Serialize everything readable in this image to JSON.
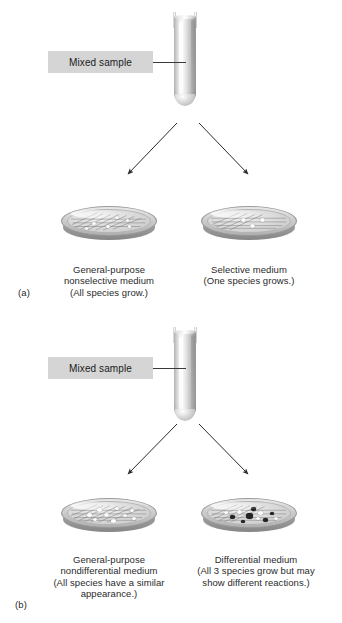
{
  "figure": {
    "background_color": "#ffffff",
    "label_box_color": "#d5d5d5"
  },
  "panels": [
    {
      "letter": "(a)",
      "tube_label": "Mixed sample",
      "dishes": [
        {
          "side": "left",
          "caption_lines": [
            "General-purpose",
            "nonselective medium",
            "(All species grow.)"
          ],
          "colonies": {
            "white_count": 6,
            "dark_count": 0
          },
          "streaked": true
        },
        {
          "side": "right",
          "caption_lines": [
            "Selective medium",
            "(One species grows.)"
          ],
          "colonies": {
            "white_count": 3,
            "dark_count": 0
          },
          "streaked": true
        }
      ]
    },
    {
      "letter": "(b)",
      "tube_label": "Mixed sample",
      "dishes": [
        {
          "side": "left",
          "caption_lines": [
            "General-purpose",
            "nondifferential medium",
            "(All species have a similar",
            "appearance.)"
          ],
          "colonies": {
            "white_count": 9,
            "dark_count": 0
          },
          "streaked": true
        },
        {
          "side": "right",
          "caption_lines": [
            "Differential medium",
            "(All 3 species grow but may",
            "show different reactions.)"
          ],
          "colonies": {
            "white_count": 5,
            "dark_count": 6
          },
          "streaked": true
        }
      ]
    }
  ]
}
